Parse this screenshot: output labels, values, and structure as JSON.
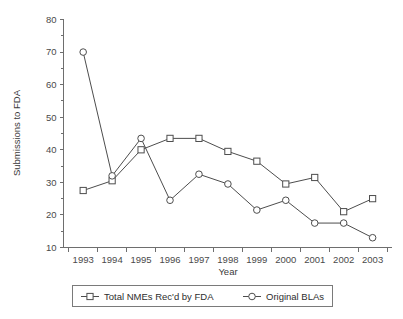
{
  "chart_data": {
    "type": "line",
    "title": "",
    "xlabel": "Year",
    "ylabel": "Submissions to FDA",
    "categories": [
      "1993",
      "1994",
      "1995",
      "1996",
      "1997",
      "1998",
      "1999",
      "2000",
      "2001",
      "2002",
      "2003"
    ],
    "xlim": [
      1993,
      2003
    ],
    "ylim": [
      10,
      80
    ],
    "yticks": [
      10,
      20,
      30,
      40,
      50,
      60,
      70,
      80
    ],
    "yminorticks": [
      15,
      25,
      35,
      45,
      55,
      65,
      75
    ],
    "grid": false,
    "legend_position": "bottom",
    "series": [
      {
        "name": "Total NMEs Rec'd by FDA",
        "marker": "square",
        "values": [
          27.5,
          30.5,
          40,
          43.5,
          43.5,
          39.5,
          36.5,
          29.5,
          31.5,
          21,
          25
        ]
      },
      {
        "name": "Original BLAs",
        "marker": "circle",
        "values": [
          70,
          32,
          43.5,
          24.5,
          32.5,
          29.5,
          21.5,
          24.5,
          17.5,
          17.5,
          13
        ]
      }
    ]
  },
  "axes": {
    "y_title": "Submissions to FDA",
    "x_title": "Year",
    "y_tick_labels": [
      "80",
      "70",
      "60",
      "50",
      "40",
      "30",
      "20",
      "10"
    ],
    "x_tick_labels": [
      "1993",
      "1994",
      "1995",
      "1996",
      "1997",
      "1998",
      "1999",
      "2000",
      "2001",
      "2002",
      "2003"
    ]
  },
  "legend": {
    "entries": [
      {
        "label": "Total NMEs Rec'd by FDA",
        "marker": "square"
      },
      {
        "label": "Original BLAs",
        "marker": "circle"
      }
    ]
  },
  "colors": {
    "line": "#4d4d4d",
    "axis": "#6e6e6e",
    "marker_fill": "#ffffff",
    "text": "#3a3a3a",
    "background": "#ffffff"
  }
}
